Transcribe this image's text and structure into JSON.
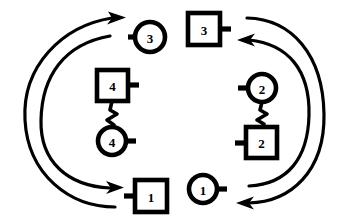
{
  "figure": {
    "background_color": "#ffffff",
    "stroke_color": "#000000",
    "width": 347,
    "height": 224
  },
  "nodes": [
    {
      "id": "circle-3",
      "label": "3",
      "shape": "circle",
      "stub_side": "left",
      "cx": 150,
      "cy": 37,
      "r": 15
    },
    {
      "id": "square-3",
      "label": "3",
      "shape": "square",
      "stub_side": "right",
      "x": 188,
      "y": 13,
      "size": 32
    },
    {
      "id": "square-4",
      "label": "4",
      "shape": "square",
      "stub_side": "right",
      "x": 97,
      "y": 70,
      "size": 31
    },
    {
      "id": "circle-4",
      "label": "4",
      "shape": "circle",
      "stub_side": "right",
      "cx": 112,
      "cy": 141,
      "r": 14
    },
    {
      "id": "circle-2",
      "label": "2",
      "shape": "circle",
      "stub_side": "left",
      "cx": 262,
      "cy": 88,
      "r": 14
    },
    {
      "id": "square-2",
      "label": "2",
      "shape": "square",
      "stub_side": "left",
      "x": 246,
      "y": 127,
      "size": 31
    },
    {
      "id": "square-1",
      "label": "1",
      "shape": "square",
      "stub_side": "left",
      "x": 135,
      "y": 180,
      "size": 32
    },
    {
      "id": "circle-1",
      "label": "1",
      "shape": "circle",
      "stub_side": "right",
      "cx": 203,
      "cy": 189,
      "r": 14
    }
  ],
  "connectors": [
    {
      "id": "zigzag-4",
      "type": "zigzag",
      "from": "square-4",
      "to": "circle-4"
    },
    {
      "id": "zigzag-2",
      "type": "zigzag",
      "from": "circle-2",
      "to": "square-2"
    }
  ],
  "arcs": [
    {
      "id": "left-outer-arc",
      "side": "left",
      "arrow": "top",
      "direction": "bottom-to-top",
      "target": "circle-3"
    },
    {
      "id": "left-inner-arc",
      "side": "left",
      "arrow": "bottom",
      "direction": "top-to-bottom",
      "target": "square-1"
    },
    {
      "id": "right-outer-arc",
      "side": "right",
      "arrow": "bottom",
      "direction": "top-to-bottom",
      "target": "circle-1"
    },
    {
      "id": "right-inner-arc",
      "side": "right",
      "arrow": "top",
      "direction": "bottom-to-top",
      "target": "square-3"
    }
  ]
}
